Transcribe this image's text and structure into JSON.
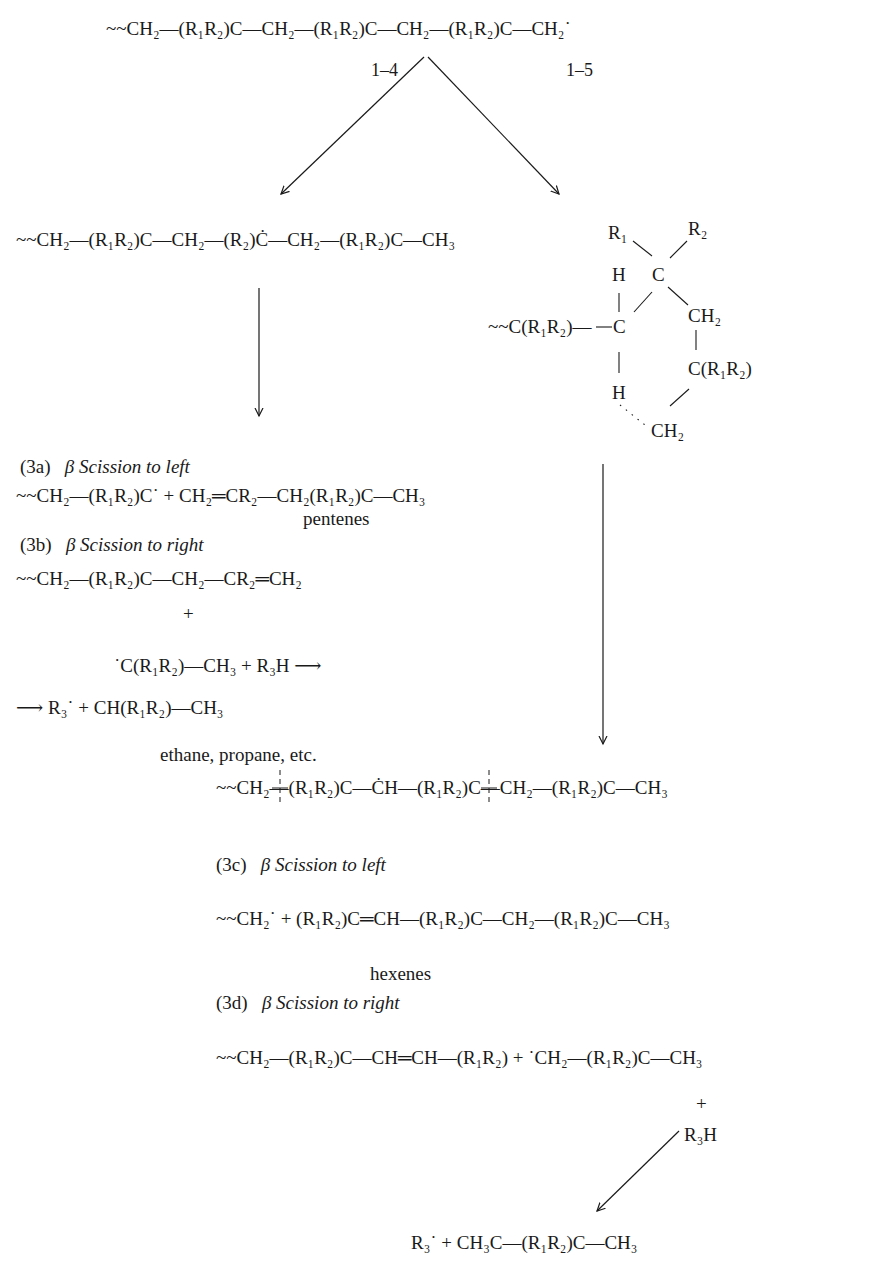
{
  "diagram": {
    "type": "reaction-mechanism",
    "start_chain": "~~CH₂—(R₁R₂)C—CH₂—(R₁R₂)C—CH₂—(R₁R₂)C—CH₂˙",
    "transfer_labels": [
      "1–4",
      "1–5"
    ],
    "branch_left": {
      "product": "~~CH₂—(R₁R₂)C—CH₂—(R₂)Ċ—CH₂—(R₁R₂)C—CH₃"
    },
    "branch_right": {
      "ring_transition_state": {
        "atoms": [
          "R₁",
          "R₂",
          "H",
          "C",
          "~~C(R₁R₂)—",
          "C",
          "CH₂",
          "C(R₁R₂)",
          "H",
          "CH₂"
        ]
      },
      "product": "~~CH₂—(R₁R₂)C—ĊH—(R₁R₂)C—CH₂—(R₁R₂)C—CH₃"
    },
    "steps": [
      {
        "id": "(3a)",
        "heading": "β Scission to left",
        "equation": "~~CH₂—(R₁R₂)C˙ + CH₂═CR₂—CH₂(R₁R₂)C—CH₃",
        "product_note": "pentenes"
      },
      {
        "id": "(3b)",
        "heading": "β Scission to right",
        "equation_line1": "~~CH₂—(R₁R₂)C—CH₂—CR₂═CH₂",
        "plus": "+",
        "equation_line2": "˙C(R₁R₂)—CH₃ + R₃H ⟶",
        "equation_line3": "⟶ R₃˙ + CH(R₁R₂)—CH₃",
        "product_note": "ethane, propane, etc."
      },
      {
        "id": "(3c)",
        "heading": "β Scission to left",
        "equation": "~~CH₂˙ + (R₁R₂)C═CH—(R₁R₂)C—CH₂—(R₁R₂)C—CH₃",
        "product_note": "hexenes"
      },
      {
        "id": "(3d)",
        "heading": "β Scission to right",
        "equation": "~~CH₂—(R₁R₂)C—CH═CH—(R₁R₂) + ˙CH₂—(R₁R₂)C—CH₃",
        "plus": "+",
        "reagent": "R₃H",
        "result": "R₃˙ + CH₃C—(R₁R₂)C—CH₃"
      }
    ]
  }
}
